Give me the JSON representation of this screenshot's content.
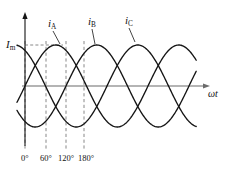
{
  "figure": {
    "name": "three-phase-current-waveform",
    "background": "#ffffff",
    "ink": "#141414",
    "axis_color": "#6b6b6b",
    "dash_color": "#7a7a7a"
  },
  "axes": {
    "x_axis_label": "ωt",
    "y_amplitude_label_base": "I",
    "y_amplitude_label_sub": "m",
    "origin_px": {
      "x": 25,
      "y": 86
    },
    "x_end_px": 210,
    "y_top_px": 12,
    "amplitude_px": 41,
    "degrees_per_px": 2.9268,
    "x_range_deg": [
      -25,
      520
    ],
    "y_range": [
      -1.15,
      1.15
    ]
  },
  "curves": [
    {
      "id": "iA",
      "label_base": "i",
      "label_sub": "A",
      "phase_deg": 0,
      "label_px": {
        "x": 48,
        "y": 18
      },
      "leader": {
        "x1": 53,
        "y1": 31,
        "x2": 60,
        "y2": 44
      }
    },
    {
      "id": "iB",
      "label_base": "i",
      "label_sub": "B",
      "phase_deg": -120,
      "label_px": {
        "x": 88,
        "y": 16
      },
      "leader": {
        "x1": 92,
        "y1": 29,
        "x2": 95,
        "y2": 44
      }
    },
    {
      "id": "iC",
      "label_base": "i",
      "label_sub": "C",
      "phase_deg": -240,
      "label_px": {
        "x": 125,
        "y": 15
      },
      "leader": {
        "x1": 129,
        "y1": 28,
        "x2": 135,
        "y2": 42
      }
    }
  ],
  "gridlines": {
    "horizontal_dashed": {
      "name": "im-level-line",
      "y_px": 45,
      "x_from_px": 25,
      "x_to_px": 63
    },
    "vertical_dashed": [
      {
        "deg": 0,
        "x_px": 25,
        "y_from_px": 41,
        "y_to_px": 150
      },
      {
        "deg": 60,
        "x_px": 46,
        "y_from_px": 41,
        "y_to_px": 150
      },
      {
        "deg": 120,
        "x_px": 66,
        "y_from_px": 41,
        "y_to_px": 150
      },
      {
        "deg": 180,
        "x_px": 84,
        "y_from_px": 41,
        "y_to_px": 150
      }
    ]
  },
  "tick_labels": [
    {
      "text": "0°",
      "x_px": 21,
      "y_px": 154
    },
    {
      "text": "60°",
      "x_px": 40,
      "y_px": 154
    },
    {
      "text": "120°",
      "x_px": 58,
      "y_px": 154
    },
    {
      "text": "180°",
      "x_px": 78,
      "y_px": 154
    }
  ],
  "chart_data": {
    "type": "line",
    "title": "",
    "xlabel": "ωt",
    "ylabel": "Iₘ",
    "grid": false,
    "legend": "inline-curve-labels",
    "x_unit": "degrees",
    "x": [
      0,
      30,
      60,
      90,
      120,
      150,
      180,
      210,
      240,
      270,
      300,
      330,
      360,
      390,
      420,
      450,
      480,
      510
    ],
    "xlim": [
      -25,
      520
    ],
    "ylim": [
      -1.15,
      1.15
    ],
    "amplitude": 1.0,
    "amplitude_label": "Im",
    "series": [
      {
        "name": "iA",
        "phase_deg": 0,
        "expression": "Im*sin(wt)",
        "values": [
          0,
          0.5,
          0.866,
          1,
          0.866,
          0.5,
          0,
          -0.5,
          -0.866,
          -1,
          -0.866,
          -0.5,
          0,
          0.5,
          0.866,
          1,
          0.866,
          0.5
        ]
      },
      {
        "name": "iB",
        "phase_deg": -120,
        "expression": "Im*sin(wt-120°)",
        "values": [
          -0.866,
          -0.5,
          0,
          0.5,
          0.866,
          1,
          0.866,
          0.5,
          0,
          -0.5,
          -0.866,
          -1,
          -0.866,
          -0.5,
          0,
          0.5,
          0.866,
          1
        ]
      },
      {
        "name": "iC",
        "phase_deg": -240,
        "expression": "Im*sin(wt+120°)",
        "values": [
          0.866,
          1,
          0.866,
          0.5,
          0,
          -0.5,
          -0.866,
          -1,
          -0.866,
          -0.5,
          0,
          0.5,
          0.866,
          1,
          0.866,
          0.5,
          0,
          -0.5
        ]
      }
    ],
    "annotations": [
      {
        "text": "0°",
        "x": 0
      },
      {
        "text": "60°",
        "x": 60
      },
      {
        "text": "120°",
        "x": 120
      },
      {
        "text": "180°",
        "x": 180
      }
    ]
  }
}
